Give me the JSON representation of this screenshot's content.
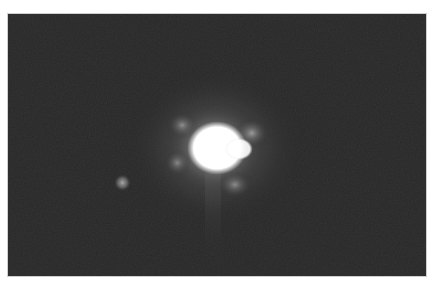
{
  "image": {
    "description": "Grayscale telescope image of a bright saturated star with a faint companion point source to its lower left",
    "background_color": "#272727",
    "border_color": "#cfcfcf",
    "objects": [
      {
        "name": "primary-star",
        "cx": 208,
        "cy": 135,
        "core_radius": 24,
        "halo_radius": 80,
        "color": "#ffffff"
      },
      {
        "name": "companion-star",
        "cx": 115,
        "cy": 170,
        "radius": 8,
        "color": "#9a9a9a"
      }
    ]
  }
}
